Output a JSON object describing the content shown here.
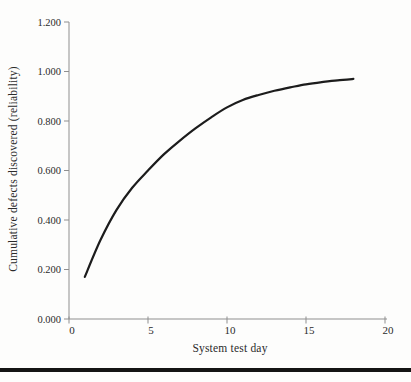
{
  "figure": {
    "background_color": "#fdfdfc",
    "bottom_rule_color": "#141414"
  },
  "chart_data": {
    "type": "line",
    "title": "",
    "xlabel": "System test day",
    "ylabel": "Cumulative defects discovered (reliability)",
    "xlim": [
      0,
      20
    ],
    "ylim": [
      0.0,
      1.2
    ],
    "grid": false,
    "legend": "none",
    "axis_color": "#8f8f8f",
    "curve_color": "#1c1c1c",
    "x_tick_values": [
      0,
      5,
      10,
      15,
      20
    ],
    "x_tick_labels": [
      "0",
      "5",
      "10",
      "15",
      "20"
    ],
    "y_tick_values": [
      0.0,
      0.2,
      0.4,
      0.6,
      0.8,
      1.0,
      1.2
    ],
    "y_tick_labels": [
      "0.000",
      "0.200",
      "0.400",
      "0.600",
      "0.800",
      "1.000",
      "1.200"
    ],
    "series": [
      {
        "name": "cumulative-defects-discovered",
        "x": [
          1,
          2,
          3,
          4,
          5,
          6,
          7,
          8,
          9,
          10,
          11,
          12,
          13,
          14,
          15,
          16,
          17,
          18
        ],
        "values": [
          0.17,
          0.32,
          0.44,
          0.53,
          0.6,
          0.665,
          0.72,
          0.77,
          0.815,
          0.855,
          0.885,
          0.905,
          0.922,
          0.936,
          0.948,
          0.957,
          0.964,
          0.97
        ]
      }
    ]
  }
}
